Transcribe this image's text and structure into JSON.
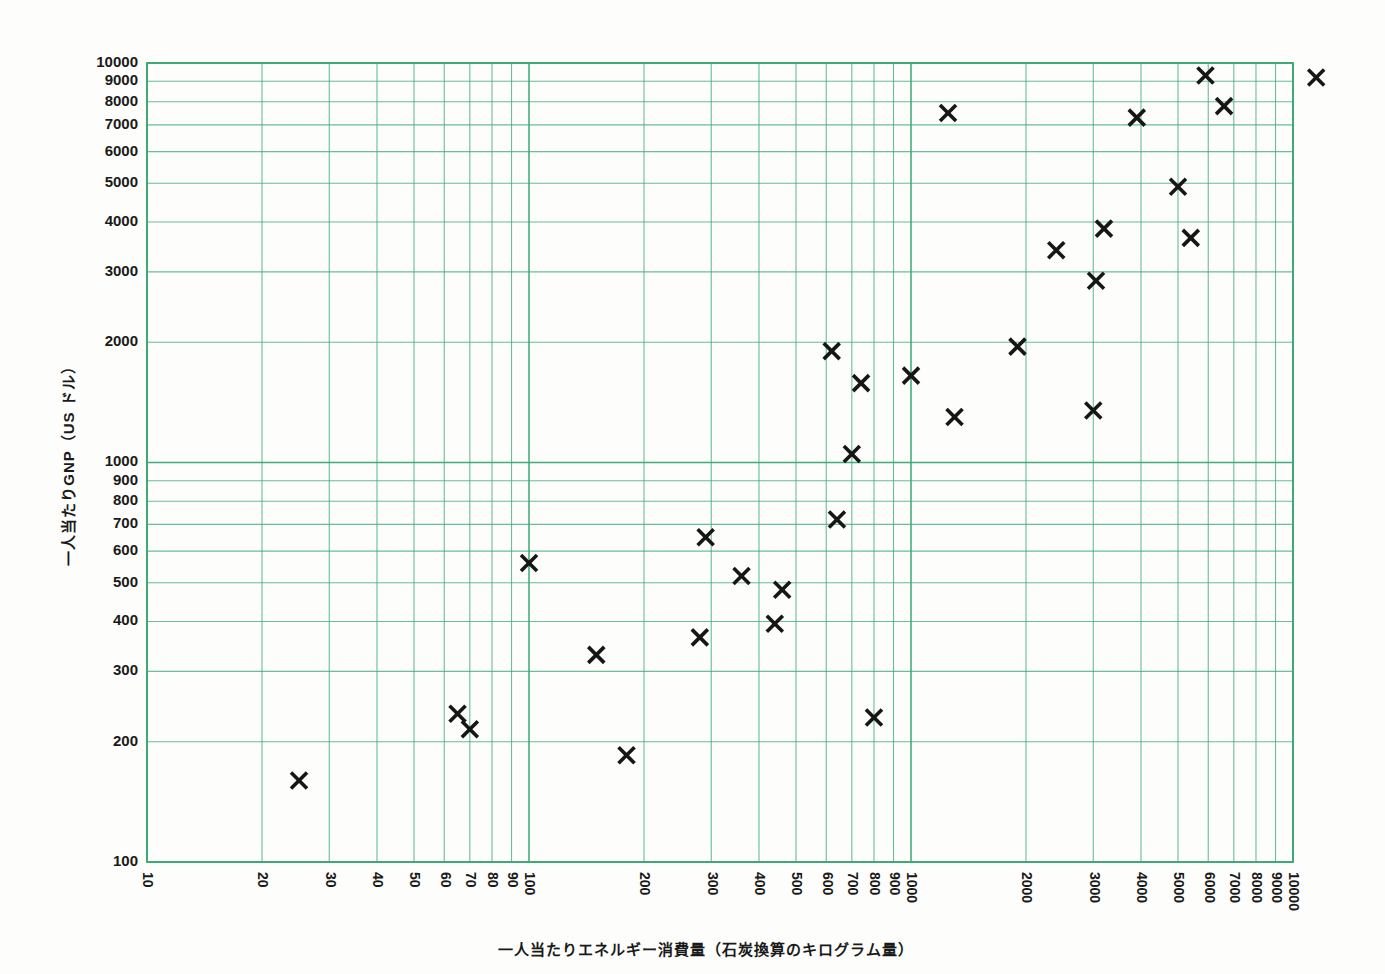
{
  "chart_data": {
    "type": "scatter",
    "title": "",
    "xlabel": "一人当たりエネルギー消費量（石炭換算のキログラム量）",
    "ylabel": "一人当たりGNP（US ドル）",
    "xscale": "log",
    "yscale": "log",
    "xlim": [
      10,
      10000
    ],
    "ylim": [
      100,
      10000
    ],
    "grid": true,
    "legend": null,
    "marker": "x-cross",
    "marker_color": "#161616",
    "grid_color": "#3aa876",
    "background": "#fdfdfb",
    "xticks": [
      10,
      20,
      30,
      40,
      50,
      60,
      70,
      80,
      90,
      100,
      200,
      300,
      400,
      500,
      600,
      700,
      800,
      900,
      1000,
      2000,
      3000,
      4000,
      5000,
      6000,
      7000,
      8000,
      9000,
      10000
    ],
    "xtick_labels": [
      "10",
      "20",
      "30",
      "40",
      "50",
      "60",
      "70",
      "80",
      "90",
      "100",
      "200",
      "300",
      "400",
      "500",
      "600",
      "700",
      "800",
      "900",
      "1000",
      "2000",
      "3000",
      "4000",
      "5000",
      "6000",
      "7000",
      "8000",
      "9000",
      "10000"
    ],
    "yticks": [
      100,
      200,
      300,
      400,
      500,
      600,
      700,
      800,
      900,
      1000,
      2000,
      3000,
      4000,
      5000,
      6000,
      7000,
      8000,
      9000,
      10000
    ],
    "ytick_labels": [
      "100",
      "200",
      "300",
      "400",
      "500",
      "600",
      "700",
      "800",
      "900",
      "1000",
      "2000",
      "3000",
      "4000",
      "5000",
      "6000",
      "7000",
      "8000",
      "9000",
      "10000"
    ],
    "points": [
      {
        "x": 25,
        "y": 160
      },
      {
        "x": 65,
        "y": 235
      },
      {
        "x": 70,
        "y": 215
      },
      {
        "x": 100,
        "y": 560
      },
      {
        "x": 150,
        "y": 330
      },
      {
        "x": 180,
        "y": 185
      },
      {
        "x": 280,
        "y": 365
      },
      {
        "x": 290,
        "y": 650
      },
      {
        "x": 360,
        "y": 520
      },
      {
        "x": 440,
        "y": 395
      },
      {
        "x": 460,
        "y": 480
      },
      {
        "x": 620,
        "y": 1900
      },
      {
        "x": 640,
        "y": 720
      },
      {
        "x": 700,
        "y": 1050
      },
      {
        "x": 740,
        "y": 1580
      },
      {
        "x": 800,
        "y": 230
      },
      {
        "x": 1000,
        "y": 1650
      },
      {
        "x": 1250,
        "y": 7500
      },
      {
        "x": 1300,
        "y": 1300
      },
      {
        "x": 1900,
        "y": 1950
      },
      {
        "x": 2400,
        "y": 3400
      },
      {
        "x": 3000,
        "y": 1350
      },
      {
        "x": 3050,
        "y": 2850
      },
      {
        "x": 3200,
        "y": 3850
      },
      {
        "x": 3900,
        "y": 7300
      },
      {
        "x": 5000,
        "y": 4900
      },
      {
        "x": 5400,
        "y": 3650
      },
      {
        "x": 5900,
        "y": 9300
      },
      {
        "x": 6600,
        "y": 7800
      },
      {
        "x": 11500,
        "y": 9200
      }
    ]
  },
  "axes": {
    "x_title": "一人当たりエネルギー消費量（石炭換算のキログラム量）",
    "y_title": "一人当たりGNP（US ドル）"
  }
}
